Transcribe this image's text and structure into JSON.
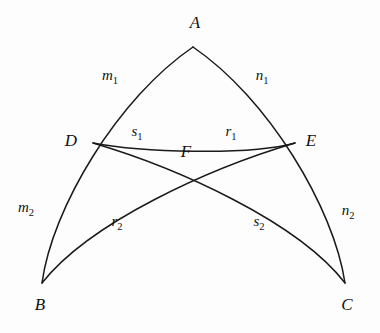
{
  "figure": {
    "kind": "geometric-diagram",
    "background_color": "#fdfdfd",
    "stroke_color": "#1a1a1a",
    "text_color": "#111111"
  },
  "vertices": [
    {
      "id": "A",
      "label": "A",
      "x": 193,
      "y": 47,
      "label_x": 195,
      "label_y": 28
    },
    {
      "id": "B",
      "label": "B",
      "x": 42,
      "y": 283,
      "label_x": 40,
      "label_y": 310
    },
    {
      "id": "C",
      "label": "C",
      "x": 345,
      "y": 283,
      "label_x": 347,
      "label_y": 310
    },
    {
      "id": "D",
      "label": "D",
      "x": 93,
      "y": 143,
      "label_x": 71,
      "label_y": 146
    },
    {
      "id": "E",
      "label": "E",
      "x": 295,
      "y": 143,
      "label_x": 311,
      "label_y": 146
    },
    {
      "id": "F",
      "label": "F",
      "x": 192,
      "y": 166,
      "label_x": 186,
      "label_y": 157
    }
  ],
  "segments": [
    {
      "id": "m1",
      "base": "m",
      "sub": "1",
      "label": "m₁",
      "from": "D",
      "to": "A",
      "label_x": 110,
      "label_y": 80
    },
    {
      "id": "n1",
      "base": "n",
      "sub": "1",
      "label": "n₁",
      "from": "A",
      "to": "E",
      "label_x": 262,
      "label_y": 80
    },
    {
      "id": "m2",
      "base": "m",
      "sub": "2",
      "label": "m₂",
      "from": "B",
      "to": "D",
      "label_x": 26,
      "label_y": 212
    },
    {
      "id": "n2",
      "base": "n",
      "sub": "2",
      "label": "n₂",
      "from": "E",
      "to": "C",
      "label_x": 348,
      "label_y": 215
    },
    {
      "id": "s1",
      "base": "s",
      "sub": "1",
      "label": "s₁",
      "from": "D",
      "to": "F",
      "label_x": 137,
      "label_y": 136
    },
    {
      "id": "r1",
      "base": "r",
      "sub": "1",
      "label": "r₁",
      "from": "F",
      "to": "E",
      "label_x": 231,
      "label_y": 136
    },
    {
      "id": "r2",
      "base": "r",
      "sub": "2",
      "label": "r₂",
      "from": "B",
      "to": "F",
      "label_x": 117,
      "label_y": 226
    },
    {
      "id": "s2",
      "base": "s",
      "sub": "2",
      "label": "s₂",
      "from": "F",
      "to": "C",
      "label_x": 259,
      "label_y": 226
    }
  ],
  "arcs": [
    {
      "id": "arc-BA",
      "name": "side-BA",
      "from": "B",
      "to": "A",
      "path": "M 42 283 C 52 208 118 98 193 47"
    },
    {
      "id": "arc-AC",
      "name": "side-AC",
      "from": "A",
      "to": "C",
      "path": "M 193 47 C 268 98 334 208 345 283"
    },
    {
      "id": "arc-DE",
      "name": "cevian-chord-DE",
      "from": "D",
      "to": "E",
      "path": "M 93 143 C 140 152 248 156 295 143"
    },
    {
      "id": "arc-BE",
      "name": "cevian-BE",
      "from": "B",
      "to": "E",
      "path": "M 42 283 C 90 222 210 168 295 143"
    },
    {
      "id": "arc-DC",
      "name": "cevian-DC",
      "from": "D",
      "to": "C",
      "path": "M 93 143 C 178 168 298 222 345 283"
    }
  ]
}
